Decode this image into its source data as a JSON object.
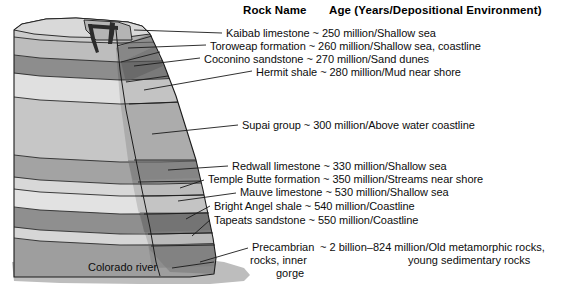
{
  "figure": {
    "title_hidden": "Grand Canyon rock strata cross-section",
    "headers": {
      "rock_name": "Rock Name",
      "age_env": "Age (Years/Depositional Environment)"
    },
    "river_label": "Colorado river",
    "colors": {
      "ink": "#0d0d0d",
      "outline": "#1a1a1a",
      "band_light": "#e3e3e3",
      "band_pale": "#d2d2d2",
      "band_mid": "#b9b9b9",
      "band_mid2": "#a8a8a8",
      "band_dark": "#8a8a8a",
      "band_darker": "#6f6f6f",
      "face_shade": "#9a9a9a",
      "crevice": "#2b2b2b",
      "river_sand": "#bdbdbd"
    }
  },
  "strata": [
    {
      "id": "kaibab",
      "name": "Kaibab limestone",
      "tilde": "~",
      "age": "250 million",
      "environment": "Shallow sea",
      "age_env": "~ 250 million/Shallow sea",
      "label_line": "Kaibab limestone ~ 250 million/Shallow sea"
    },
    {
      "id": "toroweap",
      "name": "Toroweap formation",
      "tilde": "~",
      "age": "260 million",
      "environment": "Shallow sea, coastline",
      "age_env": "~ 260 million/Shallow sea, coastline",
      "label_line": "Toroweap formation ~ 260 million/Shallow sea, coastline"
    },
    {
      "id": "coconino",
      "name": "Coconino sandstone",
      "tilde": "~",
      "age": "270 million",
      "environment": "Sand dunes",
      "age_env": "~ 270 million/Sand dunes",
      "label_line": "Coconino sandstone ~ 270 million/Sand dunes"
    },
    {
      "id": "hermit",
      "name": "Hermit shale",
      "tilde": "~",
      "age": "280 million",
      "environment": "Mud near shore",
      "age_env": "~ 280 million/Mud near shore",
      "label_line": "Hermit shale ~ 280 million/Mud near shore"
    },
    {
      "id": "supai",
      "name": "Supai group",
      "tilde": "~",
      "age": "300 million",
      "environment": "Above water coastline",
      "age_env": "~ 300 million/Above water coastline",
      "label_line": "Supai group ~ 300 million/Above water coastline"
    },
    {
      "id": "redwall",
      "name": "Redwall limestone",
      "tilde": "~",
      "age": "330 million",
      "environment": "Shallow sea",
      "age_env": "~ 330 million/Shallow sea",
      "label_line": "Redwall limestone ~ 330 million/Shallow sea"
    },
    {
      "id": "temple-butte",
      "name": "Temple Butte formation",
      "tilde": "~",
      "age": "350 million",
      "environment": "Streams near shore",
      "age_env": "~ 350 million/Streams near shore",
      "label_line": "Temple Butte formation ~ 350 million/Streams near shore"
    },
    {
      "id": "mauve",
      "name": "Mauve limestone",
      "tilde": "~",
      "age": "530 million",
      "environment": "Shallow sea",
      "age_env": "~ 530 million/Shallow sea",
      "label_line": "Mauve limestone ~ 530 million/Shallow sea"
    },
    {
      "id": "bright-angel",
      "name": "Bright Angel shale",
      "tilde": "~",
      "age": "540 million",
      "environment": "Coastline",
      "age_env": "~ 540 million/Coastline",
      "label_line": "Bright Angel shale ~ 540 million/Coastline"
    },
    {
      "id": "tapeats",
      "name": "Tapeats sandstone",
      "tilde": "~",
      "age": "550 million",
      "environment": "Coastline",
      "age_env": "~ 550 million/Coastline",
      "label_line": "Tapeats sandstone ~ 550 million/Coastline"
    }
  ],
  "precambrian": {
    "name_line1": "Precambrian",
    "name_line2": "rocks, inner",
    "name_line3": "gorge",
    "tilde": "~",
    "age": "2 billion–824 million",
    "environment_line1": "Old metamorphic rocks,",
    "environment_line2": "young sedimentary rocks",
    "age_env_line1": "~ 2 billion–824 million/Old metamorphic rocks,",
    "age_env_line2": "young sedimentary rocks"
  }
}
